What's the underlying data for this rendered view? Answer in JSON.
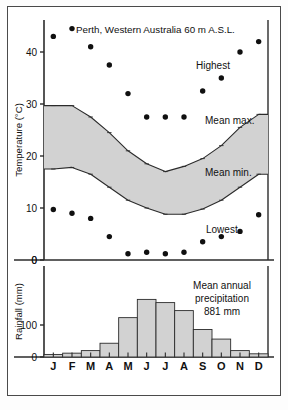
{
  "title": "Perth, Western Australia 60 m A.S.L.",
  "labels": {
    "highest": "Highest",
    "mean_max": "Mean max.",
    "mean_min": "Mean min.",
    "lowest": "Lowest",
    "temperature_axis": "Temperature (°C)",
    "rainfall_axis": "Rainfall (mm)",
    "precip_line1": "Mean annual",
    "precip_line2": "precipitation",
    "precip_line3": "881 mm"
  },
  "colors": {
    "band_fill": "#d2d2d2",
    "bar_fill": "#d2d2d2",
    "line": "#2b2b2b",
    "frame": "#4a4a4a",
    "dot": "#101010"
  },
  "chart_data": [
    {
      "type": "scatter",
      "title": "Perth, Western Australia 60 m A.S.L.",
      "xlabel": "",
      "ylabel": "Temperature (°C)",
      "ylim": [
        0,
        45
      ],
      "yticks": [
        0,
        10,
        20,
        30,
        40
      ],
      "categories": [
        "J",
        "F",
        "M",
        "A",
        "M",
        "J",
        "J",
        "A",
        "S",
        "O",
        "N",
        "D"
      ],
      "grid": false,
      "series": [
        {
          "name": "Highest",
          "type": "scatter",
          "values": [
            43.0,
            44.5,
            41.0,
            37.5,
            32.0,
            27.5,
            27.5,
            27.5,
            32.5,
            35.0,
            40.0,
            42.0
          ]
        },
        {
          "name": "Mean max.",
          "type": "line",
          "values": [
            29.7,
            29.7,
            27.5,
            24.5,
            21.0,
            18.5,
            17.0,
            18.0,
            19.5,
            22.0,
            25.5,
            28.0
          ]
        },
        {
          "name": "Mean min.",
          "type": "line",
          "values": [
            17.5,
            17.8,
            16.5,
            14.0,
            11.5,
            10.0,
            8.8,
            8.8,
            9.8,
            11.5,
            14.0,
            16.5
          ]
        },
        {
          "name": "Lowest",
          "type": "scatter",
          "values": [
            9.7,
            9.0,
            8.0,
            4.5,
            1.2,
            1.5,
            1.2,
            1.5,
            3.5,
            4.5,
            5.5,
            8.7
          ]
        }
      ]
    },
    {
      "type": "bar",
      "title": "",
      "xlabel": "",
      "ylabel": "Rainfall (mm)",
      "ylim": [
        0,
        200
      ],
      "yticks": [
        0,
        100
      ],
      "categories": [
        "J",
        "F",
        "M",
        "A",
        "M",
        "J",
        "J",
        "A",
        "S",
        "O",
        "N",
        "D"
      ],
      "values": [
        8,
        12,
        20,
        43,
        123,
        180,
        170,
        145,
        86,
        56,
        20,
        10
      ],
      "annotation": "Mean annual precipitation 881 mm",
      "grid": false
    }
  ],
  "temp_ticks": [
    "40",
    "30",
    "20",
    "10",
    "0"
  ],
  "rain_ticks": [
    "0",
    "100",
    "0"
  ],
  "months": [
    "J",
    "F",
    "M",
    "A",
    "M",
    "J",
    "J",
    "A",
    "S",
    "O",
    "N",
    "D"
  ]
}
